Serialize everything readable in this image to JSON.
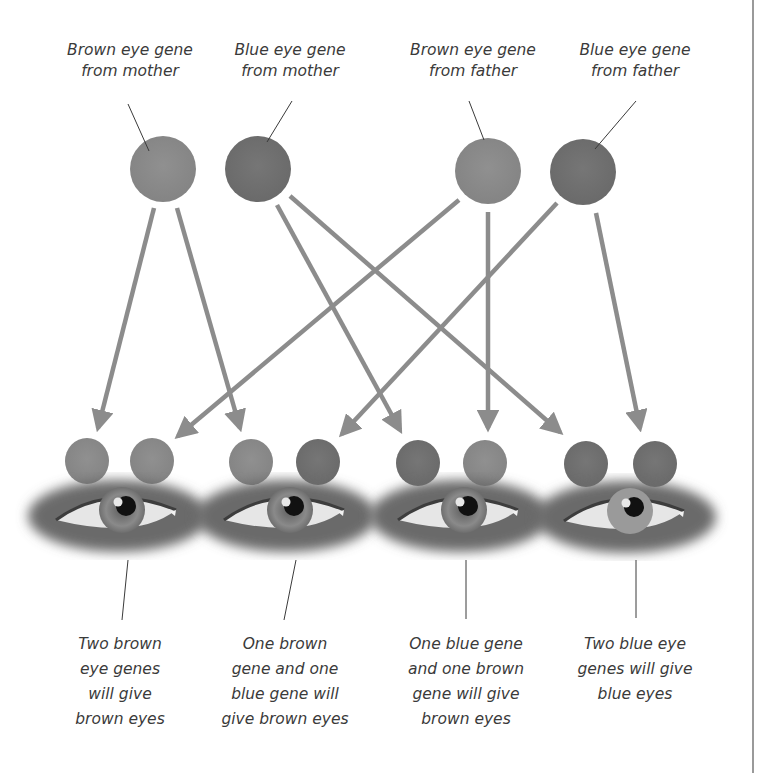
{
  "colors": {
    "brown_gene": "#8a8a8a",
    "blue_gene": "#6f6f6f",
    "arrow": "#8c8c8c",
    "text": "#3a3a3a",
    "border": "#9a9a9a"
  },
  "parents": [
    {
      "id": "mother-brown",
      "lines": [
        "Brown eye gene",
        "from mother"
      ],
      "gene": "brown"
    },
    {
      "id": "mother-blue",
      "lines": [
        "Blue eye gene",
        "from mother"
      ],
      "gene": "blue"
    },
    {
      "id": "father-brown",
      "lines": [
        "Brown eye gene",
        "from father"
      ],
      "gene": "brown"
    },
    {
      "id": "father-blue",
      "lines": [
        "Blue eye gene",
        "from father"
      ],
      "gene": "blue"
    }
  ],
  "offspring": [
    {
      "pair": 1,
      "genes": [
        "brown (mother)",
        "brown (father)"
      ],
      "result": "brown eyes",
      "lines": [
        "Two brown",
        "eye genes",
        "will give",
        "brown eyes"
      ]
    },
    {
      "pair": 2,
      "genes": [
        "brown (mother)",
        "blue (father)"
      ],
      "result": "brown eyes",
      "lines": [
        "One brown",
        "gene and one",
        "blue gene will",
        "give brown eyes"
      ]
    },
    {
      "pair": 3,
      "genes": [
        "blue (mother)",
        "brown (father)"
      ],
      "result": "brown eyes",
      "lines": [
        "One blue gene",
        "and one brown",
        "gene will give",
        "brown eyes"
      ]
    },
    {
      "pair": 4,
      "genes": [
        "blue (mother)",
        "blue (father)"
      ],
      "result": "blue eyes",
      "lines": [
        "Two blue eye",
        "genes will give",
        "blue eyes"
      ]
    }
  ]
}
